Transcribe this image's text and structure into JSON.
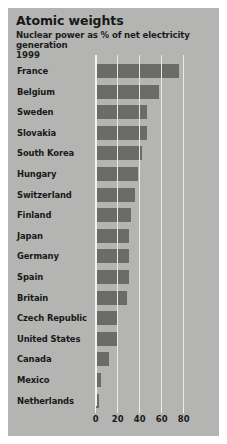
{
  "header": {
    "title": "Atomic weights",
    "subtitle": "Nuclear power as % of net electricity generation",
    "year": "1999"
  },
  "colors": {
    "panel_background": "#b2b2b0",
    "bar_fill": "#6b6b69",
    "gridline": "#e9e9e7",
    "text": "#17191b",
    "page_background": "#ffffff"
  },
  "axis": {
    "ticks": [
      {
        "label": "0",
        "value": 0
      },
      {
        "label": "20",
        "value": 20
      },
      {
        "label": "40",
        "value": 40
      },
      {
        "label": "60",
        "value": 60
      },
      {
        "label": "80",
        "value": 80
      }
    ]
  },
  "chart_data": {
    "type": "bar",
    "orientation": "horizontal",
    "title": "Atomic weights",
    "subtitle": "Nuclear power as % of net electricity generation",
    "year": "1999",
    "xlabel": "",
    "ylabel": "",
    "xlim": [
      0,
      97
    ],
    "grid": true,
    "legend": false,
    "tick_values": [
      0,
      20,
      40,
      60,
      80
    ],
    "categories": [
      "France",
      "Belgium",
      "Sweden",
      "Slovakia",
      "South Korea",
      "Hungary",
      "Switzerland",
      "Finland",
      "Japan",
      "Germany",
      "Spain",
      "Britain",
      "Czech Republic",
      "United States",
      "Canada",
      "Mexico",
      "Netherlands"
    ],
    "values": [
      76,
      58,
      47,
      47,
      43,
      39,
      36,
      33,
      31,
      31,
      31,
      29,
      21,
      20,
      13,
      5,
      4
    ],
    "bars": [
      {
        "label": "France",
        "value": 76
      },
      {
        "label": "Belgium",
        "value": 58
      },
      {
        "label": "Sweden",
        "value": 47
      },
      {
        "label": "Slovakia",
        "value": 47
      },
      {
        "label": "South Korea",
        "value": 43
      },
      {
        "label": "Hungary",
        "value": 39
      },
      {
        "label": "Switzerland",
        "value": 36
      },
      {
        "label": "Finland",
        "value": 33
      },
      {
        "label": "Japan",
        "value": 31
      },
      {
        "label": "Germany",
        "value": 31
      },
      {
        "label": "Spain",
        "value": 31
      },
      {
        "label": "Britain",
        "value": 29
      },
      {
        "label": "Czech Republic",
        "value": 21
      },
      {
        "label": "United States",
        "value": 20
      },
      {
        "label": "Canada",
        "value": 13
      },
      {
        "label": "Mexico",
        "value": 5
      },
      {
        "label": "Netherlands",
        "value": 4
      }
    ]
  }
}
